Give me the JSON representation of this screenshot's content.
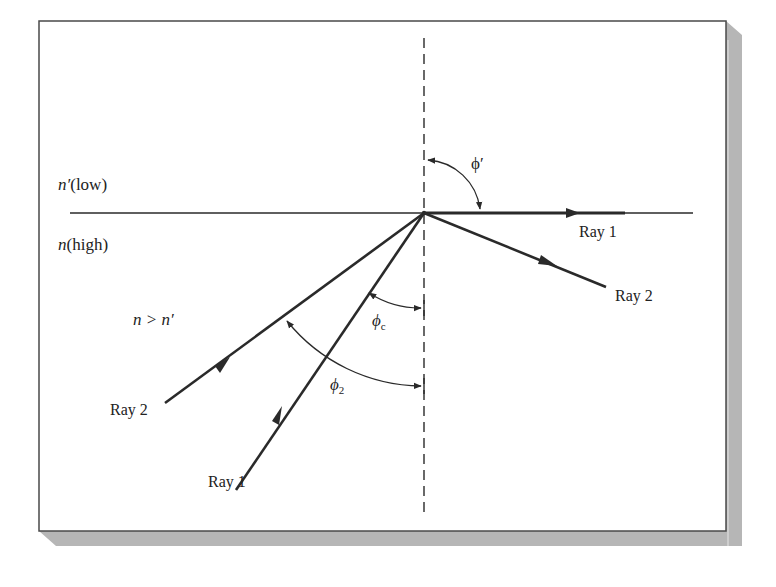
{
  "figure": {
    "type": "refraction / total internal reflection diagram",
    "colors": {
      "background": "#ffffff",
      "frame_border": "#4a4a4a",
      "shadow": "#b4b4b4",
      "ink": "#2a2a2a"
    }
  },
  "media": {
    "upper": {
      "symbol": "n′",
      "qualifier": "(low)"
    },
    "lower": {
      "symbol": "n",
      "qualifier": "(high)"
    },
    "condition": "n > n′"
  },
  "rays": {
    "ray1_incident_label": "Ray 1",
    "ray2_incident_label": "Ray 2",
    "ray1_transmitted_label": "Ray 1",
    "ray2_reflected_label": "Ray 2"
  },
  "angles": {
    "phi_prime": {
      "symbol": "ϕ",
      "mark": "′"
    },
    "phi_c": {
      "symbol": "ϕ",
      "sub": "c"
    },
    "phi_2": {
      "symbol": "ϕ",
      "sub": "2"
    }
  }
}
